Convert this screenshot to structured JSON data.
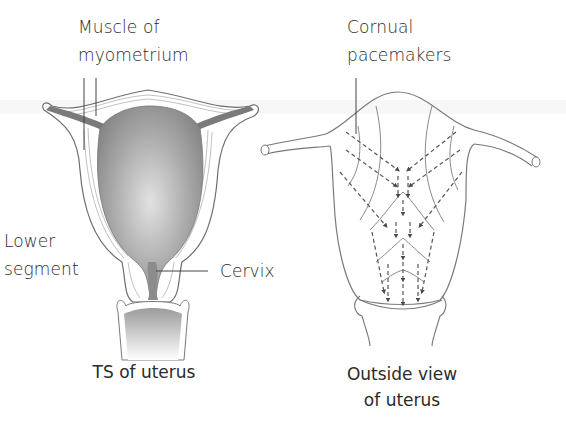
{
  "figure": {
    "panels": [
      {
        "id": "ts-of-uterus",
        "caption": "TS of uterus",
        "labels": {
          "muscle_line1": "Muscle of",
          "muscle_line2": "myometrium",
          "lower_line1": "Lower",
          "lower_line2": "segment",
          "cervix": "Cervix"
        }
      },
      {
        "id": "outside-view",
        "caption_line1": "Outside view",
        "caption_line2": "of uterus",
        "labels": {
          "pacemaker_line1": "Cornual",
          "pacemaker_line2": "pacemakers"
        }
      }
    ],
    "colors": {
      "outline": "#6e6e6e",
      "cavity_dark": "#8a8a8a",
      "cavity_light": "#d8d8d8",
      "arrow": "#4a4a4a",
      "text": "#2b2b2b"
    }
  }
}
